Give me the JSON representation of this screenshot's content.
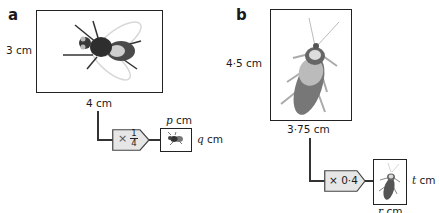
{
  "part_a": {
    "label": "a",
    "height_label": "3 cm",
    "width_label": "4 cm",
    "operator": "×",
    "fraction": {
      "numerator": "1",
      "denominator": "4"
    },
    "result_width_var": "p",
    "result_height_var": "q",
    "unit": "cm",
    "image": "fly-icon"
  },
  "part_b": {
    "label": "b",
    "height_label": "4·5 cm",
    "width_label": "3·75 cm",
    "operator_label": "× 0·4",
    "result_width_var": "r",
    "result_height_var": "t",
    "unit": "cm",
    "image": "beetle-icon"
  },
  "colors": {
    "line": "#333333",
    "operator_fill": "#e6e6e6",
    "border": "#222222"
  }
}
